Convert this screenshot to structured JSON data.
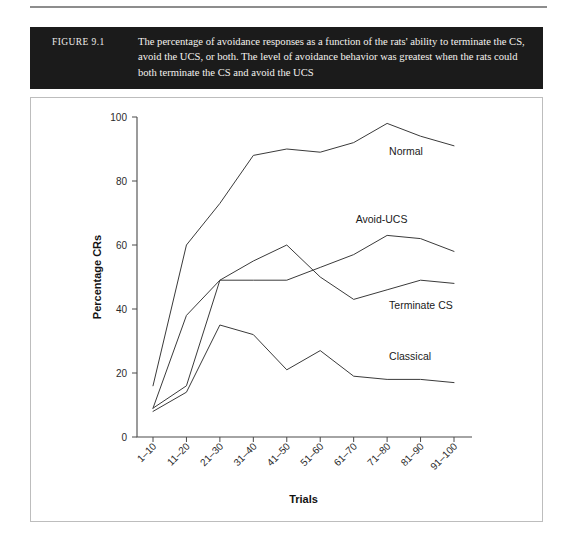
{
  "figure": {
    "label": "FIGURE 9.1",
    "caption": "The percentage of avoidance responses as a function of the rats' ability to terminate the CS, avoid the UCS, or both. The level of avoidance behavior was greatest when the rats could both terminate the CS and avoid the UCS"
  },
  "chart_data": {
    "type": "line",
    "title": "",
    "xlabel": "Trials",
    "ylabel": "Percentage CRs",
    "categories": [
      "1–10",
      "11–20",
      "21–30",
      "31–40",
      "41–50",
      "51–60",
      "61–70",
      "71–80",
      "81–90",
      "91–100"
    ],
    "ylim": [
      0,
      100
    ],
    "yticks": [
      0,
      20,
      40,
      60,
      80,
      100
    ],
    "grid": false,
    "legend_position": "inline-right-of-line-end",
    "series": [
      {
        "name": "Normal",
        "values": [
          16,
          60,
          73,
          88,
          90,
          89,
          92,
          98,
          94,
          91
        ]
      },
      {
        "name": "Avoid-UCS",
        "values": [
          9,
          38,
          49,
          49,
          49,
          53,
          57,
          63,
          62,
          58
        ]
      },
      {
        "name": "Terminate CS",
        "values": [
          9,
          16,
          49,
          55,
          60,
          50,
          43,
          46,
          49,
          48
        ]
      },
      {
        "name": "Classical",
        "values": [
          8,
          14,
          35,
          32,
          21,
          27,
          19,
          18,
          18,
          17
        ]
      }
    ],
    "annotations": [
      {
        "text": "Normal",
        "at_category": "71–80",
        "value": 88
      },
      {
        "text": "Avoid-UCS",
        "at_category": "61–70",
        "value": 67
      },
      {
        "text": "Terminate CS",
        "at_category": "71–80",
        "value": 40
      },
      {
        "text": "Classical",
        "at_category": "71–80",
        "value": 24
      }
    ]
  },
  "colors": {
    "caption_background": "#1b1b1b",
    "caption_text": "#f4f2ef",
    "line": "#3a3a3a",
    "axis": "#4a4a4a",
    "frame_border": "#bdbdbd",
    "page_background": "#ffffff"
  }
}
